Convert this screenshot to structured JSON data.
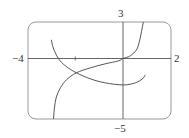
{
  "chart_data": {
    "type": "line",
    "title": "",
    "xlabel": "",
    "ylabel": "",
    "xlim": [
      -4,
      2
    ],
    "ylim": [
      -5,
      3
    ],
    "grid": false,
    "legend": null,
    "axis_labels": {
      "x_min": "−4",
      "x_max": "2",
      "y_max": "3",
      "y_min": "−5"
    },
    "ticks": {
      "x": [
        -2
      ]
    },
    "series": [
      {
        "name": "increasing curve",
        "x": [
          -2.93,
          -2.89,
          -2.81,
          -2.64,
          -2.39,
          -1.97,
          -1.38,
          -0.76,
          -0.21,
          0.0,
          0.29,
          0.55,
          0.67,
          0.76,
          0.84
        ],
        "y": [
          -5.0,
          -4.08,
          -3.18,
          -2.43,
          -1.77,
          -1.19,
          -0.78,
          -0.45,
          -0.21,
          0.0,
          0.21,
          0.7,
          1.36,
          2.19,
          3.0
        ]
      },
      {
        "name": "decreasing-then-increasing curve",
        "x": [
          -3.02,
          -2.94,
          -2.73,
          -2.43,
          -1.97,
          -1.38,
          -0.76,
          0.0,
          0.5,
          0.8,
          0.92
        ],
        "y": [
          1.53,
          0.87,
          0.0,
          -0.62,
          -1.19,
          -1.69,
          -2.02,
          -2.19,
          -2.02,
          -1.69,
          -1.36
        ]
      }
    ]
  },
  "labels": {
    "x_min": "−4",
    "x_max": "2",
    "y_max": "3",
    "y_min": "−5"
  },
  "colors": {
    "frame": "#9a9a9a",
    "axes": "#555555",
    "curve": "#555555",
    "text": "#333333"
  }
}
